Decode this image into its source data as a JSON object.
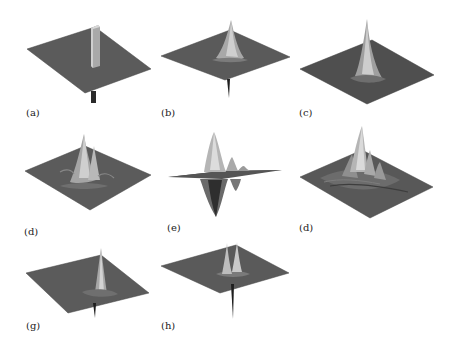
{
  "figure": {
    "panels": [
      {
        "id": "a",
        "label": "(a)",
        "description": "Flat plane with a single tall rectangular column spike and small downward spike"
      },
      {
        "id": "b",
        "label": "(b)",
        "description": "Flat plane with central tapered peak and sharp downward spike"
      },
      {
        "id": "c",
        "label": "(c)",
        "description": "Flat plane with a single tall narrow peak and small ripples"
      },
      {
        "id": "d1",
        "label": "(d)",
        "description": "Plane with twin peaks surrounded by ridges"
      },
      {
        "id": "e",
        "label": "(e)",
        "description": "Edge-on view of oscillating surface with large positive and negative lobes"
      },
      {
        "id": "d2",
        "label": "(d)",
        "description": "Plane with cluster of multiple peaks and ridges"
      },
      {
        "id": "g",
        "label": "(g)",
        "description": "Flat plane with tall narrow peak and downward spike"
      },
      {
        "id": "h",
        "label": "(h)",
        "description": "Flat plane with twin narrow peaks and long downward spike"
      }
    ],
    "colors": {
      "surface": "#5a5a5a",
      "surface_edge": "#3e3e3e",
      "peak_light": "#c9c9c9",
      "peak_mid": "#9a9a9a",
      "spike_dark": "#1e1e1e",
      "background": "#ffffff"
    }
  }
}
